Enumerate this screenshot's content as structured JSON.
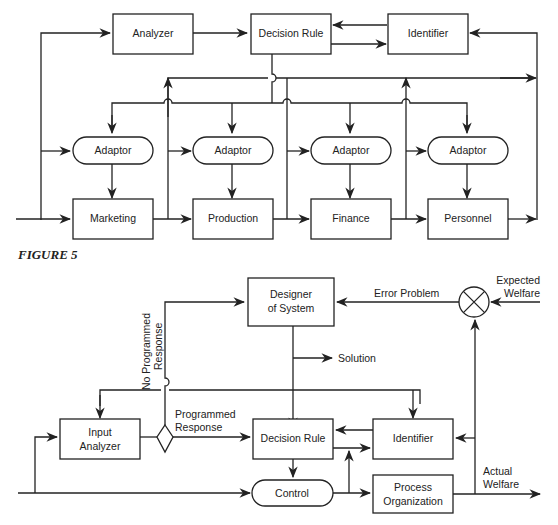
{
  "figure_top": {
    "boxes": {
      "analyzer": "Analyzer",
      "decision_rule": "Decision Rule",
      "identifier": "Identifier",
      "adaptors": [
        "Adaptor",
        "Adaptor",
        "Adaptor",
        "Adaptor"
      ],
      "functions": [
        "Marketing",
        "Production",
        "Finance",
        "Personnel"
      ]
    }
  },
  "caption": "FIGURE 5",
  "figure_bottom": {
    "boxes": {
      "designer_line1": "Designer",
      "designer_line2": "of System",
      "input_analyzer_line1": "Input",
      "input_analyzer_line2": "Analyzer",
      "decision_rule": "Decision Rule",
      "identifier": "Identifier",
      "control": "Control",
      "process_line1": "Process",
      "process_line2": "Organization"
    },
    "labels": {
      "error_problem": "Error Problem",
      "expected_line1": "Expected",
      "expected_line2": "Welfare",
      "solution": "Solution",
      "no_programmed_line1": "No Programmed",
      "no_programmed_line2": "Response",
      "programmed_line1": "Programmed",
      "programmed_line2": "Response",
      "actual_line1": "Actual",
      "actual_line2": "Welfare"
    }
  }
}
